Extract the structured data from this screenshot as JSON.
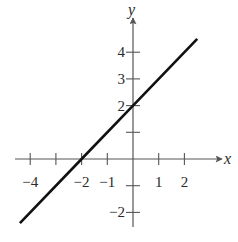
{
  "chart_data": {
    "type": "line",
    "title": "",
    "xlabel": "x",
    "ylabel": "y",
    "xlim": [
      -4.5,
      2.7
    ],
    "ylim": [
      -2.6,
      4.8
    ],
    "x_ticks": [
      -4,
      -3,
      -2,
      -1,
      1,
      2
    ],
    "x_tick_labels": [
      "-4",
      "",
      "-2",
      "-1",
      "1",
      "2"
    ],
    "y_ticks": [
      -2,
      -1,
      1,
      2,
      3,
      4
    ],
    "y_tick_labels": [
      "-2",
      "",
      "",
      "2",
      "3",
      "4"
    ],
    "grid": false,
    "legend": null,
    "series": [
      {
        "name": "y = x + 2",
        "x": [
          -4.4,
          -2,
          0,
          2.5
        ],
        "y": [
          -2.4,
          0,
          2,
          4.5
        ]
      }
    ],
    "annotations": []
  },
  "layout": {
    "origin_px": [
      133,
      159
    ],
    "unit_x_px": 25.7,
    "unit_y_px": 26.7,
    "x_axis_px": [
      15,
      222
    ],
    "y_axis_px": [
      227,
      18
    ],
    "axis_color": "#555555",
    "line_color": "#111111"
  }
}
